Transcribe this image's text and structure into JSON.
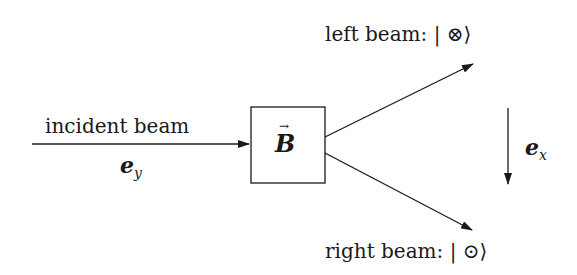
{
  "diagram": {
    "incident": {
      "label": "incident beam",
      "direction_symbol": "e",
      "direction_subscript": "y"
    },
    "field_box": {
      "symbol": "B",
      "vector_mark": "→"
    },
    "outputs": [
      {
        "label": "left beam: ",
        "ket_open": "| ",
        "state_symbol": "⊗",
        "ket_close": "⟩"
      },
      {
        "label": "right beam: ",
        "ket_open": "| ",
        "state_symbol": "⊙",
        "ket_close": "⟩"
      }
    ],
    "axis": {
      "symbol": "e",
      "subscript": "x",
      "direction": "down"
    },
    "colors": {
      "stroke": "#1a1a1a",
      "background": "#ffffff"
    }
  }
}
